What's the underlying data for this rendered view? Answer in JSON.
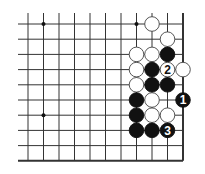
{
  "diagram": {
    "type": "go-board-fragment",
    "colors": {
      "background": "#ffffff",
      "line": "#333333",
      "black_stone": "#111111",
      "white_stone": "#ffffff",
      "white_stone_edge": "#444444"
    },
    "grid": {
      "cols": 11,
      "rows": 10,
      "x0": 28,
      "dx": 15.5,
      "y0": 24,
      "dy": 15.2,
      "open_left_x": 18,
      "open_top_y": 13,
      "right_edge": true,
      "bottom_edge": true
    },
    "star_points": [
      {
        "col": 1,
        "row": 0
      },
      {
        "col": 7,
        "row": 0
      },
      {
        "col": 1,
        "row": 6
      }
    ],
    "stones": [
      {
        "col": 8,
        "row": 0,
        "color": "white",
        "label": ""
      },
      {
        "col": 9,
        "row": 1,
        "color": "white",
        "label": ""
      },
      {
        "col": 7,
        "row": 2,
        "color": "white",
        "label": ""
      },
      {
        "col": 8,
        "row": 2,
        "color": "white",
        "label": ""
      },
      {
        "col": 9,
        "row": 2,
        "color": "black",
        "label": ""
      },
      {
        "col": 7,
        "row": 3,
        "color": "white",
        "label": ""
      },
      {
        "col": 8,
        "row": 3,
        "color": "black",
        "label": ""
      },
      {
        "col": 9,
        "row": 3,
        "color": "white",
        "label": "2"
      },
      {
        "col": 10,
        "row": 3,
        "color": "white",
        "label": ""
      },
      {
        "col": 7,
        "row": 4,
        "color": "white",
        "label": ""
      },
      {
        "col": 8,
        "row": 4,
        "color": "black",
        "label": ""
      },
      {
        "col": 9,
        "row": 4,
        "color": "black",
        "label": ""
      },
      {
        "col": 7,
        "row": 5,
        "color": "black",
        "label": ""
      },
      {
        "col": 8,
        "row": 5,
        "color": "white",
        "label": ""
      },
      {
        "col": 10,
        "row": 5,
        "color": "black",
        "label": "1"
      },
      {
        "col": 7,
        "row": 6,
        "color": "black",
        "label": ""
      },
      {
        "col": 8,
        "row": 6,
        "color": "white",
        "label": ""
      },
      {
        "col": 9,
        "row": 6,
        "color": "white",
        "label": ""
      },
      {
        "col": 7,
        "row": 7,
        "color": "black",
        "label": ""
      },
      {
        "col": 8,
        "row": 7,
        "color": "black",
        "label": ""
      },
      {
        "col": 9,
        "row": 7,
        "color": "black",
        "label": "3"
      }
    ],
    "move_labels": [
      "1",
      "2",
      "3"
    ]
  }
}
